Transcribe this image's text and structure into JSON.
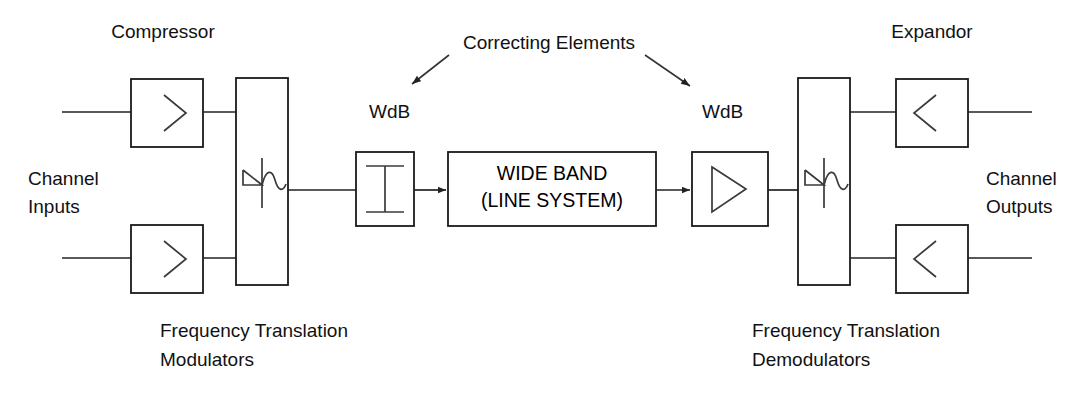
{
  "diagram": {
    "title_labels": {
      "compressor": "Compressor",
      "expandor": "Expandor",
      "correcting_elements": "Correcting Elements",
      "wdb_left": "WdB",
      "wdb_right": "WdB"
    },
    "side_labels": {
      "channel_inputs_line1": "Channel",
      "channel_inputs_line2": "Inputs",
      "channel_outputs_line1": "Channel",
      "channel_outputs_line2": "Outputs"
    },
    "bottom_labels": {
      "left_line1": "Frequency Translation",
      "left_line2": "Modulators",
      "right_line1": "Frequency Translation",
      "right_line2": "Demodulators"
    },
    "center_box": {
      "line1": "WIDE BAND",
      "line2": "(LINE SYSTEM)"
    },
    "blocks": [
      {
        "name": "compressor-top",
        "symbol": "greater-than"
      },
      {
        "name": "compressor-bottom",
        "symbol": "greater-than"
      },
      {
        "name": "modulator",
        "symbol": "frequency-translation"
      },
      {
        "name": "attenuator",
        "symbol": "i-beam"
      },
      {
        "name": "wide-band-line-system",
        "symbol": "text"
      },
      {
        "name": "amplifier",
        "symbol": "triangle"
      },
      {
        "name": "demodulator",
        "symbol": "frequency-translation"
      },
      {
        "name": "expandor-top",
        "symbol": "less-than"
      },
      {
        "name": "expandor-bottom",
        "symbol": "less-than"
      }
    ],
    "colors": {
      "stroke": "#222222",
      "text": "#111111",
      "background": "#ffffff"
    }
  }
}
